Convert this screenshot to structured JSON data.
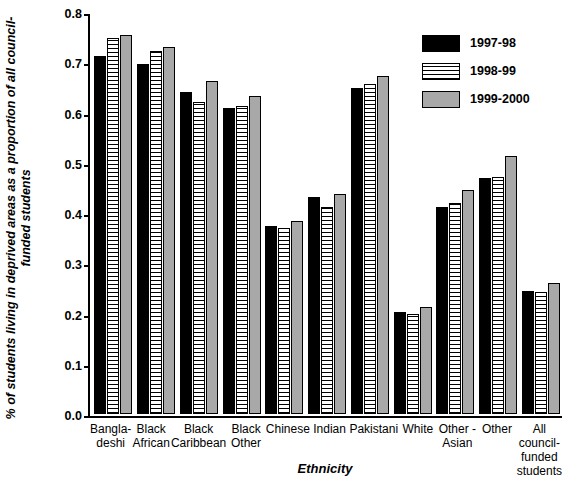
{
  "chart_data": {
    "type": "bar",
    "title": "",
    "xlabel": "Ethnicity",
    "ylabel": "% of students living in deprived areas as a proportion of all council-funded students",
    "ylim": [
      0,
      0.8
    ],
    "ytick_labels": [
      "0.0",
      "0.1",
      "0.2",
      "0.3",
      "0.4",
      "0.5",
      "0.6",
      "0.7",
      "0.8"
    ],
    "yticks": [
      0.0,
      0.1,
      0.2,
      0.3,
      0.4,
      0.5,
      0.6,
      0.7,
      0.8
    ],
    "grid": false,
    "legend_position": "top-right",
    "categories": [
      "Bangla-\ndeshi",
      "Black\nAfrican",
      "Black\nCaribbean",
      "Black\nOther",
      "Chinese",
      "Indian",
      "Pakistani",
      "White",
      "Other -\nAsian",
      "Other",
      "All council-\nfunded\nstudents"
    ],
    "category_lines": [
      [
        "Bangla-",
        "deshi"
      ],
      [
        "Black",
        "African"
      ],
      [
        "Black",
        "Caribbean"
      ],
      [
        "Black",
        "Other"
      ],
      [
        "Chinese"
      ],
      [
        "Indian"
      ],
      [
        "Pakistani"
      ],
      [
        "White"
      ],
      [
        "Other -",
        "Asian"
      ],
      [
        "Other"
      ],
      [
        "All council-",
        "funded",
        "students"
      ]
    ],
    "series": [
      {
        "name": "1997-98",
        "color": "#000000",
        "values": [
          0.712,
          0.697,
          0.641,
          0.608,
          0.374,
          0.431,
          0.648,
          0.203,
          0.412,
          0.469,
          0.245
        ]
      },
      {
        "name": "1998-99",
        "color": "#ffffff",
        "values": [
          0.749,
          0.722,
          0.62,
          0.612,
          0.37,
          0.412,
          0.657,
          0.199,
          0.419,
          0.472,
          0.243
        ]
      },
      {
        "name": "1999-2000",
        "color": "#a8a8a8",
        "values": [
          0.754,
          0.73,
          0.663,
          0.632,
          0.384,
          0.438,
          0.673,
          0.213,
          0.445,
          0.514,
          0.26
        ]
      }
    ]
  }
}
